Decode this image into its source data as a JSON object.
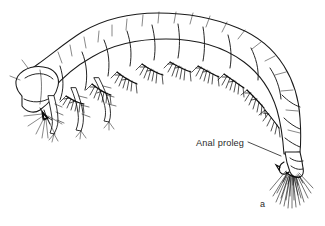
{
  "figure": {
    "background_color": "#ffffff",
    "ink_color": "#1a1a1a",
    "width": 325,
    "height": 226,
    "figure_letter": "a",
    "annotations": [
      {
        "id": "anal-proleg",
        "label": "Anal proleg",
        "text_x": 196,
        "text_y": 146,
        "leader_from_x": 248,
        "leader_from_y": 142,
        "leader_to_x": 281,
        "leader_to_y": 156
      }
    ],
    "anatomy": {
      "head_label": "head capsule",
      "thorax_label": "thoracic segments",
      "abdomen_label": "abdominal segments",
      "gills_label": "branched abdominal gills",
      "legs_label": "thoracic legs",
      "proleg_label": "anal proleg with hook and setal brush",
      "segment_count": 10
    }
  }
}
